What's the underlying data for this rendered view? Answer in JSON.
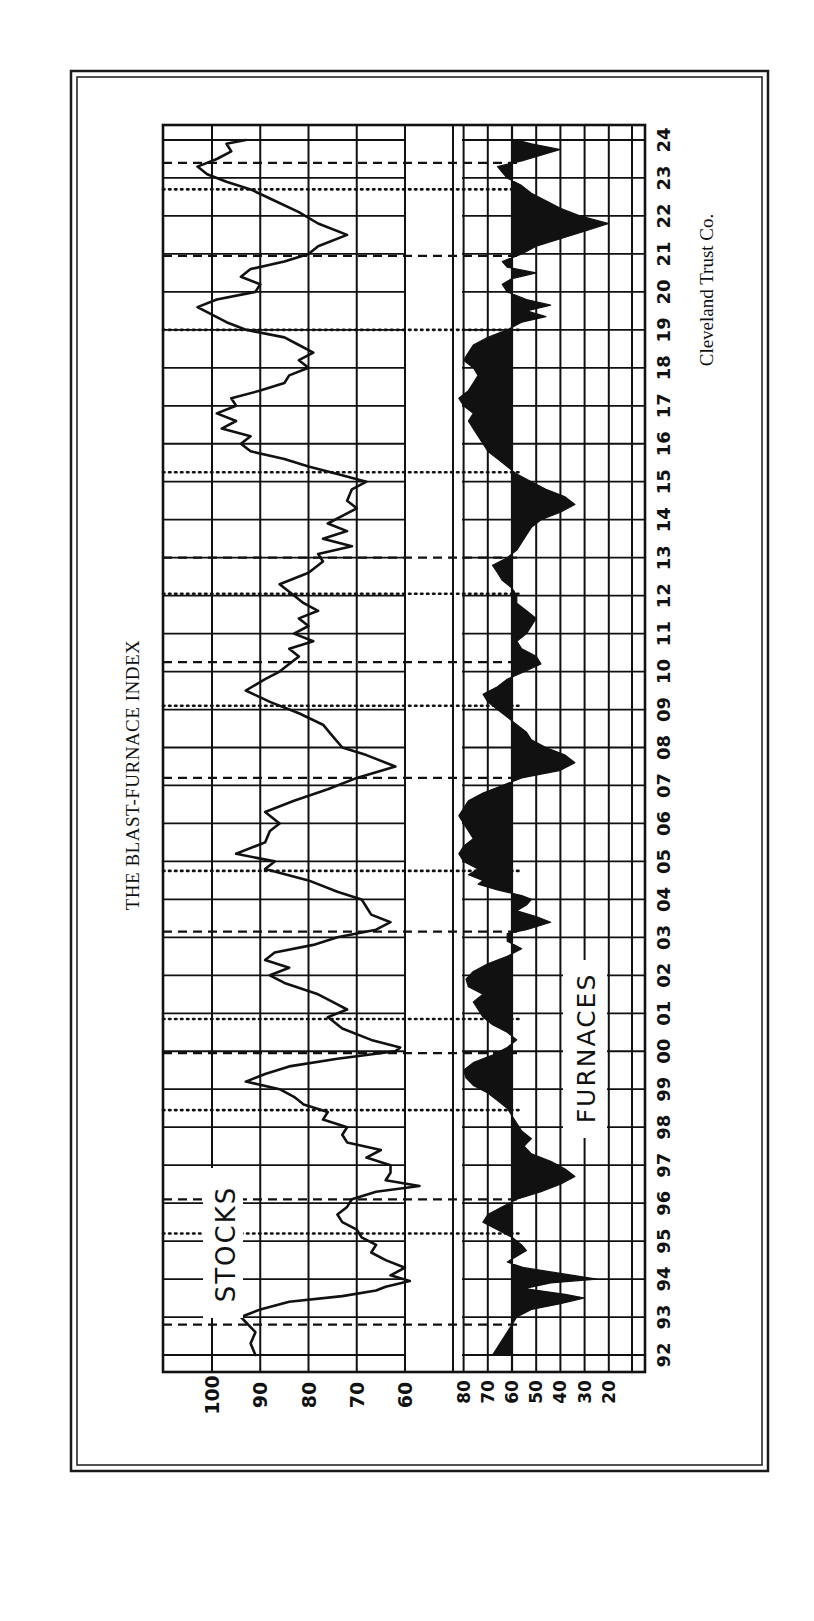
{
  "page": {
    "title": "THE BLAST-FURNACE INDEX",
    "credit": "Cleveland Trust Co.",
    "label_stocks": "STOCKS",
    "label_furnaces": "FURNACES"
  },
  "colors": {
    "ink": "#111111",
    "paper": "#ffffff",
    "grid": "#1a1a1a"
  },
  "chart_data": {
    "type": "line",
    "title": "THE BLAST-FURNACE INDEX",
    "orientation": "rotated 90 degrees counter-clockwise (years run bottom-to-top on the page)",
    "source": "Cleveland Trust Co.",
    "xlabel": "Year",
    "x_tick_labels": [
      "92",
      "93",
      "94",
      "95",
      "96",
      "97",
      "98",
      "99",
      "00",
      "01",
      "02",
      "03",
      "04",
      "05",
      "06",
      "07",
      "08",
      "09",
      "10",
      "11",
      "12",
      "13",
      "14",
      "15",
      "16",
      "17",
      "18",
      "19",
      "20",
      "21",
      "22",
      "23",
      "24"
    ],
    "grid": true,
    "panels": [
      {
        "name": "STOCKS",
        "type": "line",
        "y_tick_labels": [
          "100",
          "90",
          "80",
          "70",
          "60"
        ],
        "ylim": [
          50,
          105
        ],
        "series": [
          {
            "name": "Stocks",
            "x": [
              1892.0,
              1892.3,
              1892.6,
              1893.0,
              1893.2,
              1893.4,
              1893.55,
              1893.7,
              1893.8,
              1893.95,
              1894.1,
              1894.3,
              1894.5,
              1894.7,
              1894.9,
              1895.1,
              1895.3,
              1895.5,
              1895.7,
              1895.9,
              1896.1,
              1896.3,
              1896.45,
              1896.6,
              1896.8,
              1897.0,
              1897.2,
              1897.4,
              1897.6,
              1897.8,
              1898.0,
              1898.2,
              1898.4,
              1898.6,
              1898.8,
              1899.0,
              1899.2,
              1899.4,
              1899.6,
              1899.8,
              1900.0,
              1900.1,
              1900.3,
              1900.6,
              1900.9,
              1901.1,
              1901.3,
              1901.5,
              1901.8,
              1902.0,
              1902.2,
              1902.4,
              1902.6,
              1902.8,
              1903.0,
              1903.2,
              1903.4,
              1903.6,
              1903.8,
              1904.0,
              1904.2,
              1904.5,
              1904.8,
              1905.0,
              1905.2,
              1905.5,
              1905.8,
              1906.0,
              1906.3,
              1906.6,
              1906.9,
              1907.2,
              1907.5,
              1907.8,
              1908.0,
              1908.3,
              1908.6,
              1908.9,
              1909.2,
              1909.5,
              1909.8,
              1910.0,
              1910.2,
              1910.4,
              1910.6,
              1910.8,
              1911.0,
              1911.2,
              1911.4,
              1911.6,
              1911.8,
              1912.0,
              1912.3,
              1912.6,
              1912.9,
              1913.1,
              1913.3,
              1913.5,
              1913.7,
              1913.9,
              1914.1,
              1914.3,
              1914.5,
              1914.8,
              1915.0,
              1915.2,
              1915.4,
              1915.6,
              1915.8,
              1916.0,
              1916.2,
              1916.4,
              1916.6,
              1916.8,
              1917.0,
              1917.2,
              1917.4,
              1917.6,
              1917.8,
              1918.0,
              1918.2,
              1918.4,
              1918.6,
              1918.8,
              1919.0,
              1919.2,
              1919.4,
              1919.6,
              1919.8,
              1920.0,
              1920.2,
              1920.4,
              1920.6,
              1920.8,
              1921.0,
              1921.2,
              1921.5,
              1921.8,
              1922.1,
              1922.4,
              1922.7,
              1922.9,
              1923.1,
              1923.3,
              1923.5,
              1923.7,
              1923.9,
              1924.0
            ],
            "y": [
              91,
              92,
              91,
              94,
              90,
              84,
              73,
              66,
              64,
              59,
              63,
              60,
              64,
              67,
              66,
              69,
              70,
              73,
              74,
              72,
              71,
              66,
              57,
              64,
              63,
              63,
              68,
              65,
              72,
              73,
              72,
              77,
              76,
              81,
              83,
              86,
              93,
              89,
              84,
              74,
              62,
              61,
              67,
              73,
              76,
              72,
              75,
              78,
              85,
              88,
              84,
              89,
              87,
              79,
              74,
              66,
              63,
              67,
              68,
              69,
              74,
              80,
              89,
              87,
              95,
              89,
              88,
              86,
              89,
              83,
              76,
              70,
              62,
              68,
              73,
              75,
              77,
              82,
              88,
              93,
              89,
              86,
              84,
              82,
              84,
              79,
              83,
              80,
              82,
              78,
              81,
              83,
              86,
              80,
              77,
              78,
              71,
              77,
              72,
              76,
              73,
              70,
              72,
              71,
              68,
              74,
              80,
              85,
              92,
              94,
              92,
              98,
              95,
              99,
              95,
              96,
              90,
              85,
              84,
              80,
              82,
              79,
              82,
              85,
              93,
              97,
              100,
              103,
              99,
              91,
              90,
              94,
              92,
              85,
              80,
              78,
              72,
              78,
              82,
              87,
              92,
              97,
              101,
              103,
              99,
              96,
              97,
              93,
              90,
              92,
              95,
              97
            ]
          }
        ]
      },
      {
        "name": "FURNACES",
        "type": "area",
        "baseline": 60,
        "y_tick_labels": [
          "80",
          "70",
          "60",
          "50",
          "40",
          "30",
          "20"
        ],
        "ylim": [
          15,
          85
        ],
        "series": [
          {
            "name": "Furnaces",
            "x": [
              1892.0,
              1892.2,
              1892.5,
              1892.8,
              1893.0,
              1893.2,
              1893.35,
              1893.5,
              1893.6,
              1893.75,
              1893.9,
              1894.0,
              1894.15,
              1894.3,
              1894.45,
              1894.6,
              1894.75,
              1894.9,
              1895.1,
              1895.3,
              1895.5,
              1895.7,
              1895.9,
              1896.1,
              1896.3,
              1896.5,
              1896.7,
              1896.9,
              1897.1,
              1897.3,
              1897.5,
              1897.7,
              1897.9,
              1898.1,
              1898.3,
              1898.5,
              1898.7,
              1898.9,
              1899.1,
              1899.3,
              1899.5,
              1899.7,
              1899.9,
              1900.1,
              1900.3,
              1900.5,
              1900.7,
              1900.9,
              1901.1,
              1901.3,
              1901.5,
              1901.7,
              1901.9,
              1902.1,
              1902.3,
              1902.5,
              1902.7,
              1902.9,
              1903.1,
              1903.2,
              1903.4,
              1903.55,
              1903.7,
              1903.85,
              1904.0,
              1904.1,
              1904.25,
              1904.4,
              1904.5,
              1904.65,
              1904.8,
              1905.0,
              1905.2,
              1905.4,
              1905.6,
              1905.8,
              1906.0,
              1906.2,
              1906.4,
              1906.6,
              1906.8,
              1907.0,
              1907.2,
              1907.4,
              1907.6,
              1907.8,
              1908.0,
              1908.2,
              1908.4,
              1908.6,
              1908.8,
              1909.0,
              1909.2,
              1909.4,
              1909.6,
              1909.8,
              1910.0,
              1910.2,
              1910.4,
              1910.6,
              1910.8,
              1911.0,
              1911.2,
              1911.4,
              1911.6,
              1911.8,
              1912.0,
              1912.2,
              1912.4,
              1912.6,
              1912.8,
              1913.0,
              1913.2,
              1913.4,
              1913.6,
              1913.8,
              1914.0,
              1914.2,
              1914.4,
              1914.6,
              1914.8,
              1915.0,
              1915.2,
              1915.4,
              1915.6,
              1915.8,
              1916.0,
              1916.2,
              1916.4,
              1916.6,
              1916.8,
              1917.0,
              1917.2,
              1917.4,
              1917.6,
              1917.8,
              1918.0,
              1918.2,
              1918.4,
              1918.6,
              1918.8,
              1919.0,
              1919.2,
              1919.35,
              1919.5,
              1919.65,
              1919.8,
              1920.0,
              1920.2,
              1920.35,
              1920.5,
              1920.65,
              1920.8,
              1921.0,
              1921.2,
              1921.4,
              1921.6,
              1921.8,
              1922.0,
              1922.2,
              1922.4,
              1922.6,
              1922.8,
              1923.0,
              1923.15,
              1923.3,
              1923.45,
              1923.6,
              1923.75,
              1923.9,
              1924.0
            ],
            "y": [
              68,
              66,
              63,
              60,
              58,
              52,
              40,
              30,
              38,
              55,
              44,
              25,
              40,
              55,
              62,
              58,
              54,
              56,
              60,
              66,
              72,
              70,
              64,
              58,
              48,
              40,
              34,
              38,
              44,
              52,
              55,
              52,
              56,
              58,
              60,
              62,
              66,
              70,
              76,
              79,
              80,
              76,
              68,
              62,
              58,
              62,
              68,
              72,
              74,
              76,
              72,
              78,
              79,
              76,
              70,
              62,
              56,
              62,
              62,
              54,
              44,
              50,
              58,
              54,
              52,
              56,
              66,
              74,
              72,
              78,
              74,
              80,
              82,
              80,
              76,
              78,
              80,
              82,
              80,
              78,
              72,
              64,
              56,
              40,
              34,
              38,
              46,
              52,
              54,
              58,
              62,
              66,
              70,
              72,
              66,
              62,
              55,
              48,
              50,
              56,
              58,
              54,
              52,
              50,
              54,
              58,
              58,
              60,
              64,
              66,
              68,
              62,
              58,
              56,
              54,
              52,
              48,
              40,
              34,
              38,
              46,
              52,
              58,
              62,
              66,
              70,
              72,
              74,
              76,
              78,
              76,
              80,
              82,
              78,
              76,
              74,
              76,
              80,
              78,
              76,
              70,
              62,
              56,
              46,
              54,
              44,
              54,
              62,
              64,
              60,
              50,
              62,
              64,
              56,
              50,
              40,
              30,
              20,
              32,
              40,
              46,
              52,
              56,
              62,
              64,
              66,
              56,
              48,
              40,
              52,
              58
            ]
          }
        ]
      }
    ],
    "reference_lines": {
      "dashed_years": [
        1892.8,
        1896.1,
        1899.95,
        1903.15,
        1907.2,
        1910.25,
        1913.0,
        1920.95,
        1923.4
      ],
      "dotted_years": [
        1895.2,
        1898.45,
        1900.85,
        1904.75,
        1909.1,
        1912.05,
        1915.25,
        1919.0,
        1922.7
      ]
    }
  }
}
